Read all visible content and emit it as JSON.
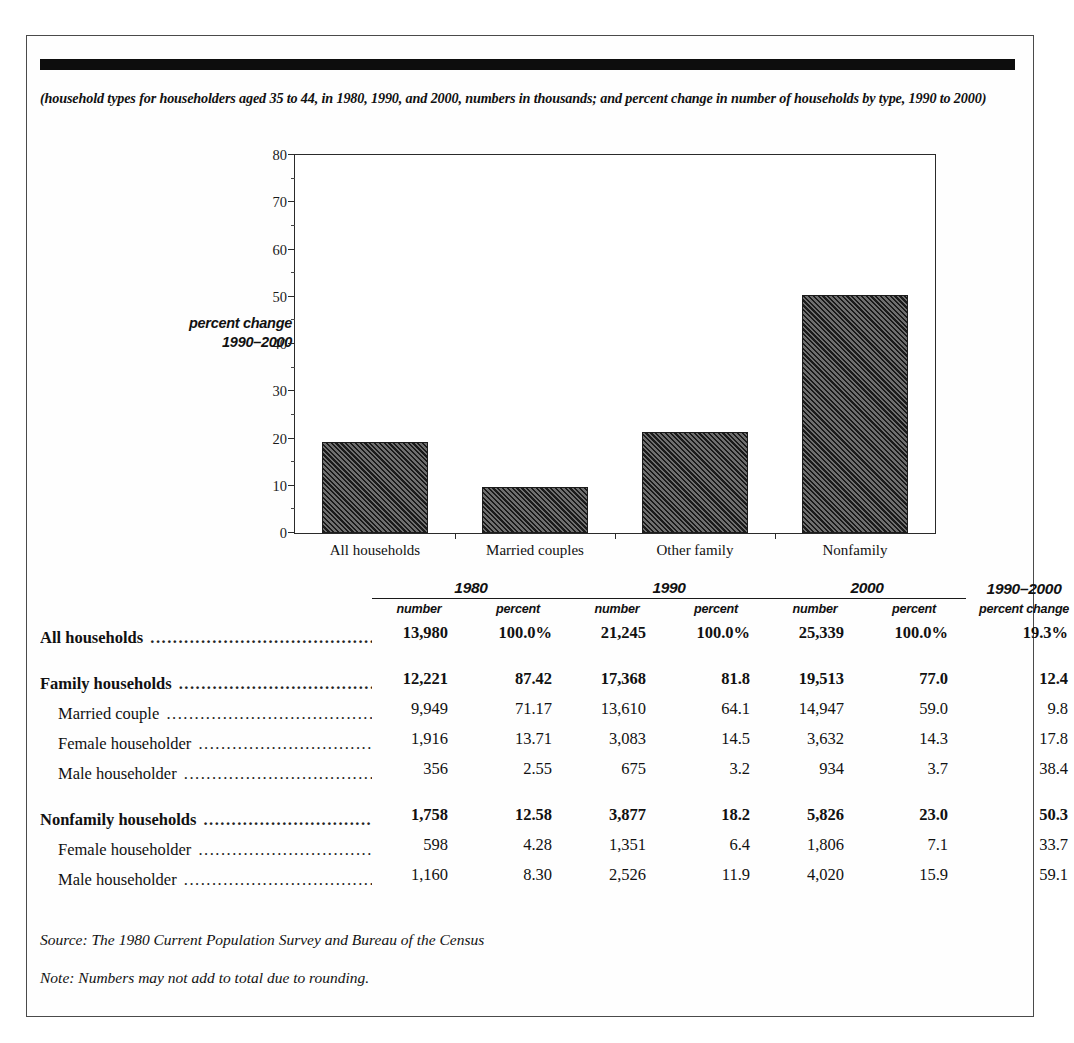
{
  "figure": {
    "subtitle": "(household types for householders aged 35 to 44, in 1980, 1990, and 2000, numbers in thousands; and percent change in number of households by type, 1990 to 2000)",
    "source_note": "Source: The 1980 Current Population Survey and Bureau of the Census",
    "rounding_note": "Note: Numbers may not add to total due to rounding.",
    "axis_title_line1": "percent change",
    "axis_title_line2": "1990–2000"
  },
  "chart_data": {
    "type": "bar",
    "title": "",
    "categories": [
      "All households",
      "Married couples",
      "Other family",
      "Nonfamily"
    ],
    "values": [
      19.3,
      9.8,
      21.4,
      50.3
    ],
    "xlabel": "",
    "ylabel": "percent change 1990–2000",
    "ylim": [
      0,
      80
    ],
    "yticks": [
      0,
      10,
      20,
      30,
      40,
      50,
      60,
      70,
      80
    ],
    "ytick_labels": [
      "0",
      "10",
      "20",
      "30",
      "40",
      "50",
      "60",
      "70",
      "80"
    ],
    "minor_tick_step": 5,
    "grid": false,
    "legend": "none",
    "bar_fill": "diagonal-hatch",
    "bar_color": "#3a3a3a"
  },
  "table": {
    "year_headers": [
      {
        "year": "1980",
        "sub": [
          "number",
          "percent"
        ]
      },
      {
        "year": "1990",
        "sub": [
          "number",
          "percent"
        ]
      },
      {
        "year": "2000",
        "sub": [
          "number",
          "percent"
        ]
      }
    ],
    "change_header": {
      "line1": "1990–2000",
      "line2": "percent change"
    },
    "leader": "........................................................",
    "rows": [
      {
        "label": "All households",
        "bold": true,
        "indent": false,
        "spacer_before": false,
        "n1980": "13,980",
        "p1980": "100.0%",
        "n1990": "21,245",
        "p1990": "100.0%",
        "n2000": "25,339",
        "p2000": "100.0%",
        "change": "19.3%"
      },
      {
        "label": "Family households",
        "bold": true,
        "indent": false,
        "spacer_before": true,
        "n1980": "12,221",
        "p1980": "87.42",
        "n1990": "17,368",
        "p1990": "81.8",
        "n2000": "19,513",
        "p2000": "77.0",
        "change": "12.4"
      },
      {
        "label": "Married couple",
        "bold": false,
        "indent": true,
        "spacer_before": false,
        "n1980": "9,949",
        "p1980": "71.17",
        "n1990": "13,610",
        "p1990": "64.1",
        "n2000": "14,947",
        "p2000": "59.0",
        "change": "9.8"
      },
      {
        "label": "Female householder",
        "bold": false,
        "indent": true,
        "spacer_before": false,
        "n1980": "1,916",
        "p1980": "13.71",
        "n1990": "3,083",
        "p1990": "14.5",
        "n2000": "3,632",
        "p2000": "14.3",
        "change": "17.8"
      },
      {
        "label": "Male householder",
        "bold": false,
        "indent": true,
        "spacer_before": false,
        "n1980": "356",
        "p1980": "2.55",
        "n1990": "675",
        "p1990": "3.2",
        "n2000": "934",
        "p2000": "3.7",
        "change": "38.4"
      },
      {
        "label": "Nonfamily households",
        "bold": true,
        "indent": false,
        "spacer_before": true,
        "n1980": "1,758",
        "p1980": "12.58",
        "n1990": "3,877",
        "p1990": "18.2",
        "n2000": "5,826",
        "p2000": "23.0",
        "change": "50.3"
      },
      {
        "label": "Female householder",
        "bold": false,
        "indent": true,
        "spacer_before": false,
        "n1980": "598",
        "p1980": "4.28",
        "n1990": "1,351",
        "p1990": "6.4",
        "n2000": "1,806",
        "p2000": "7.1",
        "change": "33.7"
      },
      {
        "label": "Male householder",
        "bold": false,
        "indent": true,
        "spacer_before": false,
        "n1980": "1,160",
        "p1980": "8.30",
        "n1990": "2,526",
        "p1990": "11.9",
        "n2000": "4,020",
        "p2000": "15.9",
        "change": "59.1"
      }
    ]
  }
}
